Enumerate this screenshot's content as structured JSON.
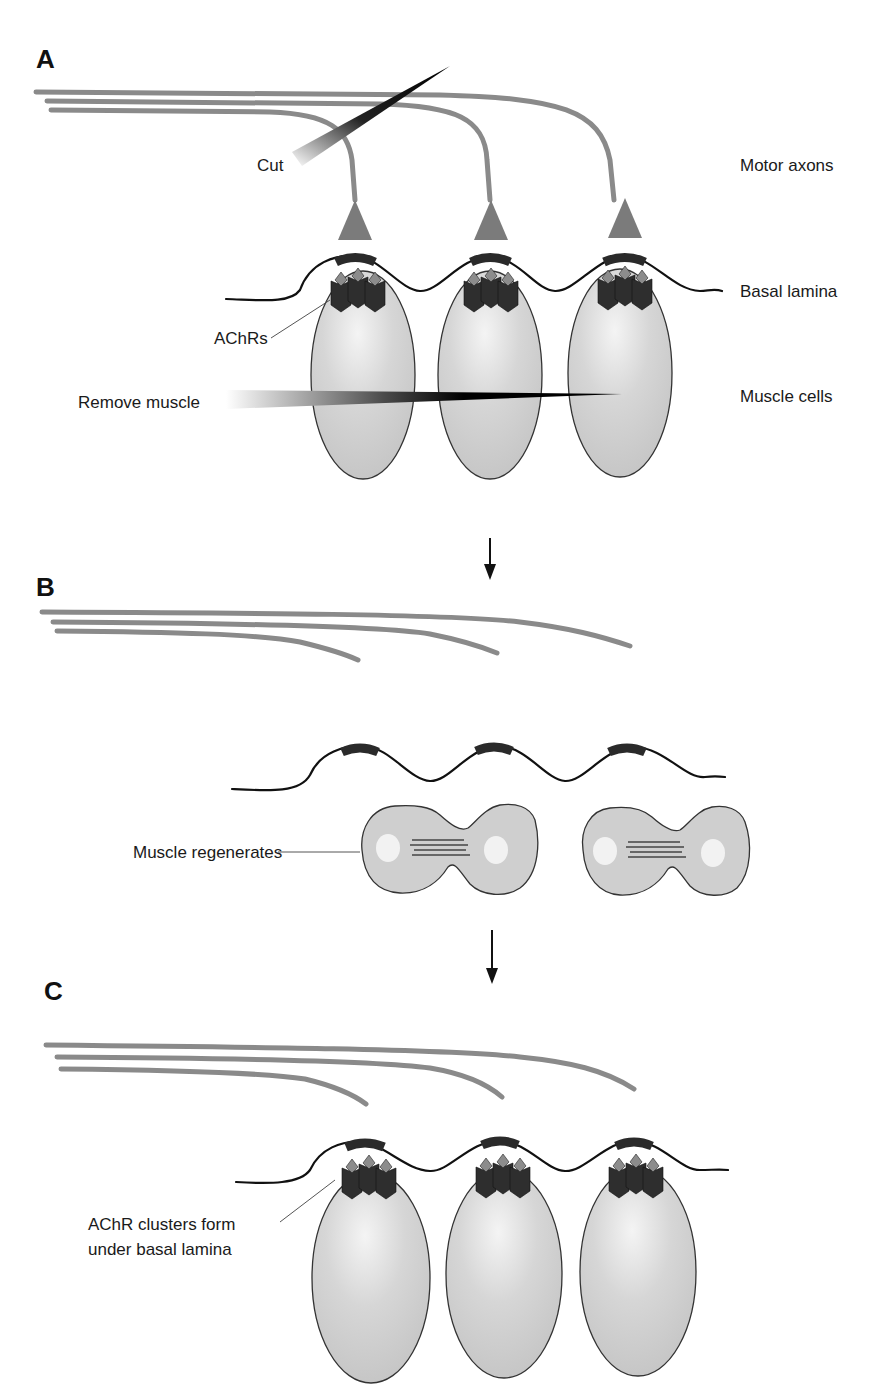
{
  "figure": {
    "panels": [
      {
        "id": "A",
        "letter": "A",
        "labels": {
          "cut": "Cut",
          "motor_axons": "Motor axons",
          "basal_lamina": "Basal lamina",
          "achrs": "AChRs",
          "remove_muscle": "Remove muscle",
          "muscle_cells": "Muscle cells"
        },
        "axon_count": 3,
        "muscle_cell_count": 3
      },
      {
        "id": "B",
        "letter": "B",
        "labels": {
          "muscle_regenerates": "Muscle regenerates"
        },
        "axon_count": 3,
        "regenerating_cell_count": 2
      },
      {
        "id": "C",
        "letter": "C",
        "labels": {
          "achr_clusters_line1": "AChR clusters form",
          "achr_clusters_line2": "under basal lamina"
        },
        "axon_count": 3,
        "muscle_cell_count": 3
      }
    ],
    "colors": {
      "axon": "#8a8a8a",
      "nerve_terminal": "#7b7b7b",
      "muscle_cell": "#cfcfcf",
      "achr_body": "#2e2e2e",
      "achr_top": "#8c8c8c",
      "basal_lamina": "#111111",
      "synaptic_patch": "#2a2a2a"
    },
    "icons": {
      "flow_arrow": "down-arrow-icon",
      "cut_blade": "blade-icon",
      "remove_blade": "blade-icon"
    }
  }
}
